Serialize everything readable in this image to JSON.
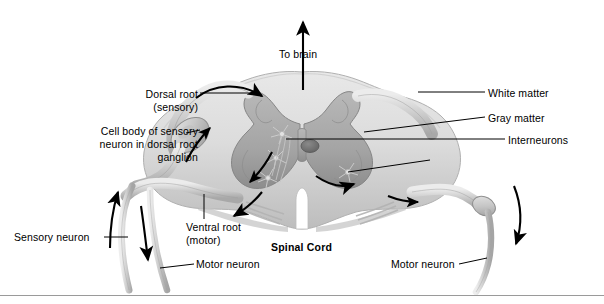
{
  "figure": {
    "title_label": "Spinal Cord",
    "labels": {
      "to_brain": "To brain",
      "dorsal_root": "Dorsal root\n(sensory)",
      "cell_body": "Cell body of sensory\nneuron in dorsal root\nganglion",
      "white_matter": "White matter",
      "gray_matter": "Gray matter",
      "interneurons": "Interneurons",
      "ventral_root": "Ventral root\n(motor)",
      "sensory_neuron": "Sensory neuron",
      "motor_neuron_left": "Motor neuron",
      "motor_neuron_right": "Motor neuron"
    },
    "colors": {
      "background": "#ffffff",
      "text": "#000000",
      "leader_line": "#000000",
      "white_matter": "#d9d9d9",
      "gray_matter": "#a9a9a9",
      "gray_matter_dark": "#8f8f8f",
      "nerve": "#c9c9c9",
      "nerve_outline": "#9b9b9b",
      "arrow": "#000000",
      "central_canal": "#6d6d6d",
      "rule": "#9a9a9a"
    },
    "icons": {
      "to_brain_arrow": "arrow-up-icon",
      "flow_arrow": "curved-arrow-icon"
    }
  }
}
